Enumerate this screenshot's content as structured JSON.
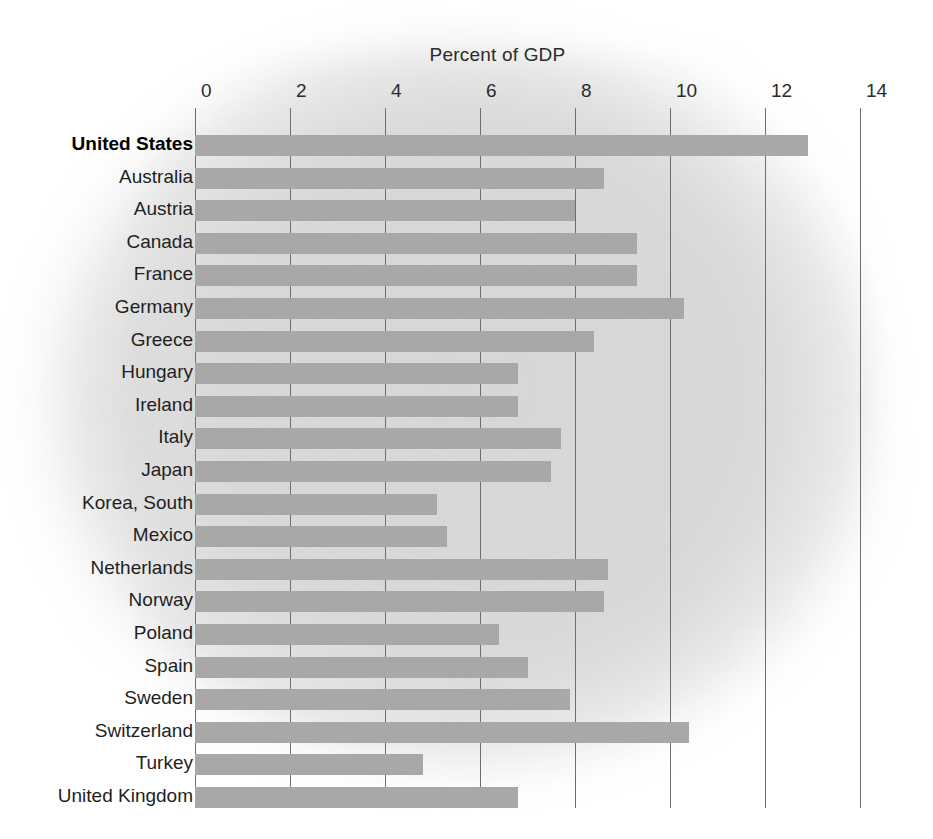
{
  "chart_data": {
    "type": "bar",
    "orientation": "horizontal",
    "title": "Percent of GDP",
    "xlabel": "Percent of GDP",
    "ylabel": "",
    "xlim": [
      0,
      14
    ],
    "xticks": [
      0,
      2,
      4,
      6,
      8,
      10,
      12,
      14
    ],
    "xtick_labels": [
      "0",
      "2",
      "4",
      "6",
      "8",
      "10",
      "12",
      "14"
    ],
    "grid": "vertical",
    "legend": "none",
    "bar_color": "#a8a8a8",
    "highlight_category": "United States",
    "categories": [
      "United States",
      "Australia",
      "Austria",
      "Canada",
      "France",
      "Germany",
      "Greece",
      "Hungary",
      "Ireland",
      "Italy",
      "Japan",
      "Korea, South",
      "Mexico",
      "Netherlands",
      "Norway",
      "Poland",
      "Spain",
      "Sweden",
      "Switzerland",
      "Turkey",
      "United Kingdom"
    ],
    "values": [
      12.9,
      8.6,
      8.0,
      9.3,
      9.3,
      10.3,
      8.4,
      6.8,
      6.8,
      7.7,
      7.5,
      5.1,
      5.3,
      8.7,
      8.6,
      6.4,
      7.0,
      7.9,
      10.4,
      4.8,
      6.8
    ]
  }
}
